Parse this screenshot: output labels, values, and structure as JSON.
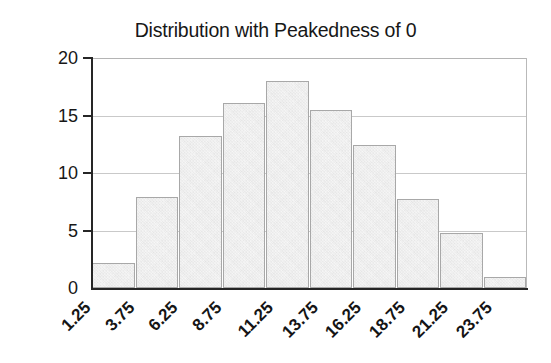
{
  "chart_data": {
    "type": "bar",
    "title": "Distribution with Peakedness of 0",
    "xlabel": "",
    "ylabel": "% of Success Cases",
    "categories": [
      "1.25",
      "3.75",
      "6.25",
      "8.75",
      "11.25",
      "13.75",
      "16.25",
      "18.75",
      "21.25",
      "23.75"
    ],
    "values": [
      2.2,
      7.9,
      13.2,
      16.1,
      18.0,
      15.5,
      12.4,
      7.7,
      4.8,
      1.0
    ],
    "ylim": [
      0,
      20
    ],
    "yticks": [
      0,
      5,
      10,
      15,
      20
    ],
    "ytick_labels": [
      "0",
      "5",
      "10",
      "15",
      "20"
    ],
    "grid": true,
    "grid_axis": "y",
    "legend": "none",
    "bar_fill_color": "#e2e2e2",
    "bar_edge_color": "#a8a8a8",
    "axis_color": "#262626",
    "gridline_color": "#c9c9c9",
    "background_color": "#ffffff",
    "text_color": "#171717"
  }
}
